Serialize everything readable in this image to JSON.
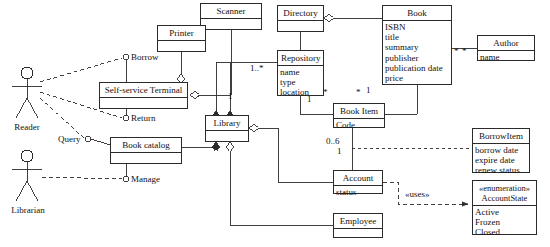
{
  "diagram": {
    "type": "uml-class-diagram",
    "width": 550,
    "height": 247,
    "line_color": "#2b2b2b",
    "background": "#ffffff"
  },
  "actors": [
    {
      "name": "Reader",
      "label": "Reader",
      "x": 27,
      "y": 70
    },
    {
      "name": "Librarian",
      "label": "Librarian",
      "x": 27,
      "y": 155
    }
  ],
  "usecases": [
    {
      "name": "borrow",
      "label": "Borrow",
      "x": 131,
      "y": 58
    },
    {
      "name": "return",
      "label": "Return",
      "x": 131,
      "y": 118
    },
    {
      "name": "query",
      "label": "Query",
      "x": 62,
      "y": 142
    },
    {
      "name": "manage",
      "label": "Manage",
      "x": 131,
      "y": 179
    }
  ],
  "classes": [
    {
      "key": "scanner",
      "name": "Scanner",
      "attributes": [],
      "x": 200,
      "y": 3,
      "w": 62,
      "h": 27
    },
    {
      "key": "printer",
      "name": "Printer",
      "attributes": [],
      "x": 157,
      "y": 25,
      "w": 49,
      "h": 27
    },
    {
      "key": "terminal",
      "name": "Self-service Terminal",
      "attributes": [],
      "x": 99,
      "y": 82,
      "w": 89,
      "h": 27
    },
    {
      "key": "library",
      "name": "Library",
      "attributes": [],
      "x": 205,
      "y": 115,
      "w": 44,
      "h": 27
    },
    {
      "key": "bookcatalog",
      "name": "Book catalog",
      "attributes": [],
      "x": 110,
      "y": 137,
      "w": 72,
      "h": 27
    },
    {
      "key": "directory",
      "name": "Directory",
      "attributes": [],
      "x": 277,
      "y": 5,
      "w": 47,
      "h": 27
    },
    {
      "key": "repository",
      "name": "Repository",
      "attributes": [
        "name",
        "type",
        "location"
      ],
      "x": 277,
      "y": 50,
      "w": 47,
      "h": 46
    },
    {
      "key": "book",
      "name": "Book",
      "attributes": [
        "ISBN",
        "title",
        "summary",
        "publisher",
        "publication date",
        "price"
      ],
      "x": 382,
      "y": 5,
      "w": 70,
      "h": 80
    },
    {
      "key": "author",
      "name": "Author",
      "attributes": [
        "name"
      ],
      "x": 477,
      "y": 35,
      "w": 58,
      "h": 26
    },
    {
      "key": "bookitem",
      "name": "Book Item",
      "attributes": [
        "Code"
      ],
      "x": 333,
      "y": 103,
      "w": 52,
      "h": 25
    },
    {
      "key": "borrowitem",
      "name": "BorrowItem",
      "attributes": [
        "borrow date",
        "expire date",
        "renew status"
      ],
      "x": 472,
      "y": 128,
      "w": 58,
      "h": 45
    },
    {
      "key": "account",
      "name": "Account",
      "attributes": [
        "status"
      ],
      "x": 333,
      "y": 170,
      "w": 50,
      "h": 24
    },
    {
      "key": "employee",
      "name": "Employee",
      "attributes": [],
      "x": 333,
      "y": 213,
      "w": 50,
      "h": 25
    },
    {
      "key": "accountstate",
      "name": "AccountState",
      "stereotype": "«enumeration»",
      "attributes": [
        "Active",
        "Frozen",
        "Closed"
      ],
      "x": 472,
      "y": 180,
      "w": 65,
      "h": 55
    }
  ],
  "multiplicities": [
    {
      "key": "repo_library_many",
      "label": "1..*",
      "x": 253,
      "y": 67
    },
    {
      "key": "library_one",
      "label": "1",
      "x": 230,
      "y": 95
    },
    {
      "key": "repo_item_one",
      "label": "1",
      "x": 310,
      "y": 97
    },
    {
      "key": "repo_item_many",
      "label": "*",
      "x": 325,
      "y": 90
    },
    {
      "key": "book_item_many",
      "label": "*",
      "x": 358,
      "y": 90
    },
    {
      "key": "book_item_one",
      "label": "1",
      "x": 368,
      "y": 88
    },
    {
      "key": "author_many_left",
      "label": "*",
      "x": 456,
      "y": 50
    },
    {
      "key": "author_many_right",
      "label": "*",
      "x": 464,
      "y": 50
    },
    {
      "key": "account_items",
      "label": "0..6",
      "x": 328,
      "y": 139
    },
    {
      "key": "account_one",
      "label": "1",
      "x": 339,
      "y": 149
    }
  ],
  "dependencies": [
    {
      "key": "account_uses_state",
      "label": "«uses»",
      "x": 409,
      "y": 194
    }
  ]
}
